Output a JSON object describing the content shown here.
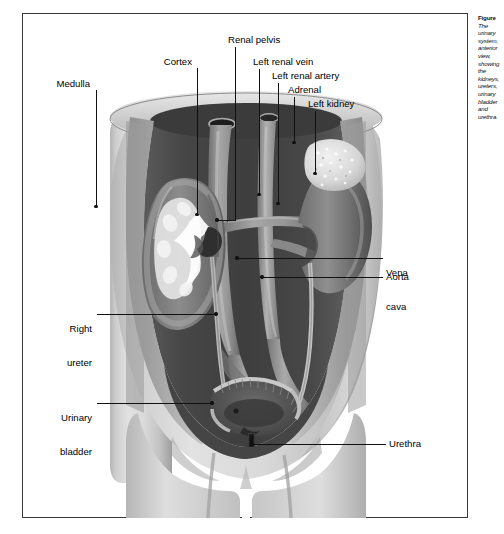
{
  "figure": {
    "caption_lines": [
      "Figure",
      "The urinary",
      "system,",
      "anterior view,",
      "showing the",
      "kidneys,",
      "ureters,",
      "urinary",
      "bladder and",
      "urethra."
    ],
    "frame_color": "#3a3a3a",
    "background_color": "#ffffff",
    "label_color": "#000000",
    "leader_color": "#111111"
  },
  "labels": {
    "medulla": "Medulla",
    "cortex": "Cortex",
    "renal_pelvis": "Renal pelvis",
    "left_renal_vein": "Left renal vein",
    "left_renal_artery": "Left renal artery",
    "adrenal": "Adrenal",
    "left_kidney": "Left kidney",
    "vena_cava_line1": "Vena",
    "vena_cava_line2": "cava",
    "aorta": "Aorta",
    "right_ureter_line1": "Right",
    "right_ureter_line2": "ureter",
    "urinary_bladder_line1": "Urinary",
    "urinary_bladder_line2": "bladder",
    "urethra": "Urethra"
  },
  "artwork": {
    "description": "Grayscale medical illustration: cutaway human torso, anterior view, coronal section revealing the urinary tract",
    "structures": [
      "right kidney sectioned showing cortex, medulla and renal pelvis",
      "left kidney intact with adrenal gland on superior pole",
      "inferior vena cava",
      "abdominal aorta with common iliac bifurcation",
      "left renal vein and left renal artery",
      "right and left ureters",
      "urinary bladder",
      "urethra"
    ],
    "palette": {
      "skin_light": "#d9d9d9",
      "skin_mid": "#bdbdbd",
      "skin_shadow": "#9a9a9a",
      "cavity_dark": "#4a4a4a",
      "cavity_darker": "#3b3b3b",
      "organ_mid": "#8c8c8c",
      "organ_light": "#cfcfcf",
      "vessel": "#8f8f8f",
      "adrenal": "#e4e4e4"
    }
  }
}
